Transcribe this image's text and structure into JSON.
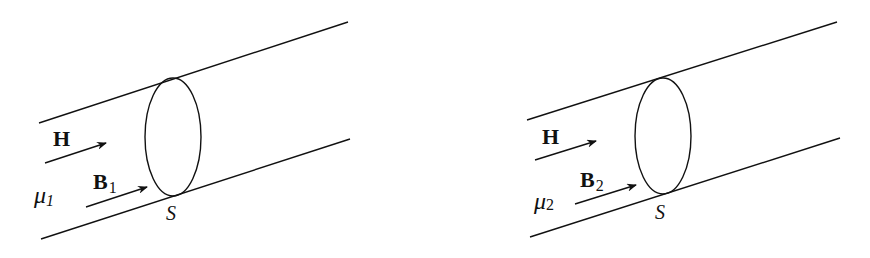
{
  "figures": [
    {
      "id": "medium-1",
      "field_label": "H",
      "flux_label": "B",
      "flux_subscript": "1",
      "permeability_label": "μ",
      "permeability_subscript": "1",
      "surface_label": "S"
    },
    {
      "id": "medium-2",
      "field_label": "H",
      "flux_label": "B",
      "flux_subscript": "2",
      "permeability_label": "μ",
      "permeability_subscript": "2",
      "surface_label": "S"
    }
  ],
  "colors": {
    "stroke": "#111111",
    "background": "#ffffff"
  }
}
